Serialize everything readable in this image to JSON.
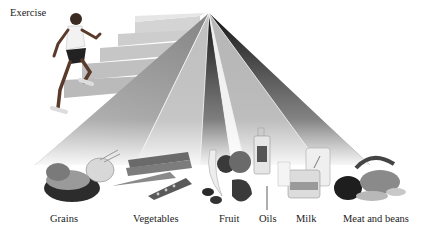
{
  "diagram": {
    "type": "food-pyramid",
    "exercise_label": "Exercise",
    "apex": {
      "x": 209,
      "y": 13
    },
    "groups": [
      {
        "name": "grains",
        "label": "Grains",
        "label_x": 50,
        "shade": "#8a8a8a"
      },
      {
        "name": "vegetables",
        "label": "Vegetables",
        "label_x": 133,
        "shade": "#b0b0b0"
      },
      {
        "name": "fruit",
        "label": "Fruit",
        "label_x": 219,
        "shade": "#1e1e1e"
      },
      {
        "name": "oils",
        "label": "Oils",
        "label_x": 259,
        "shade": "#e8e8e8"
      },
      {
        "name": "milk",
        "label": "Milk",
        "label_x": 296,
        "shade": "#a8a8a8"
      },
      {
        "name": "meat-and-beans",
        "label": "Meat and beans",
        "label_x": 343,
        "shade": "#2a2a2a"
      }
    ],
    "colors": {
      "background": "#ffffff",
      "stairs": "#c8c8c8",
      "text": "#222222"
    }
  }
}
